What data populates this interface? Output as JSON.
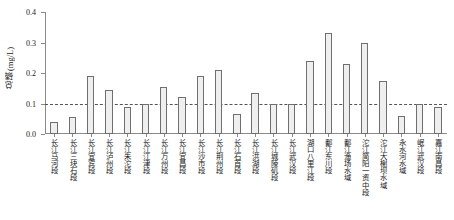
{
  "chart_data": {
    "type": "bar",
    "title": "",
    "xlabel": "",
    "ylabel": "总磷(mg/L)",
    "ylim": [
      0.0,
      0.4
    ],
    "yticks": [
      "0.0",
      "0.1",
      "0.2",
      "0.3",
      "0.4"
    ],
    "ytick_values": [
      0.0,
      0.1,
      0.2,
      0.3,
      0.4
    ],
    "grid": false,
    "legend": "none",
    "reference_line": {
      "value": 0.1,
      "style": "dashed",
      "label": ""
    },
    "categories": [
      "长江马河段",
      "长江三块石段",
      "长江宜宾段",
      "长江泸州段",
      "长江朱沱段",
      "长江江津段",
      "长江万州段",
      "长江宜昌段",
      "长江沙市段",
      "长江荆州段",
      "长江石首段",
      "长江洪湖段",
      "长江城陵矶段",
      "长江武汉段",
      "湖口八里江段",
      "鄱江东川段",
      "鄱江渔场水域",
      "沱江简阳一资中段",
      "沱江大榭坝水域",
      "永水河水域",
      "岷江武汉段",
      "嘉江南昌段"
    ],
    "values": [
      0.04,
      0.055,
      0.19,
      0.145,
      0.09,
      0.1,
      0.155,
      0.12,
      0.19,
      0.21,
      0.065,
      0.135,
      0.1,
      0.1,
      0.24,
      0.33,
      0.23,
      0.3,
      0.175,
      0.06,
      0.1,
      0.09
    ]
  },
  "style": {
    "bar_fill": "#efefef",
    "bar_stroke": "#6f6f6f",
    "axis_color": "#8a8a8a",
    "ref_color": "#555555",
    "text_color": "#1a1a1a"
  }
}
